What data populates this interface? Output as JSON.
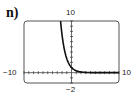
{
  "figure_label": "n)",
  "window": {
    "xmin_label": "−10",
    "xmax_label": "10",
    "ymax_label": "10",
    "ymin_label": "−2"
  },
  "chart_data": {
    "type": "line",
    "title": "n)",
    "xlabel": "",
    "ylabel": "",
    "xlim": [
      -10,
      10
    ],
    "ylim": [
      -2,
      10
    ],
    "x_tick_step": 1,
    "y_tick_step": 1,
    "grid": false,
    "legend": null,
    "series": [
      {
        "name": "curve",
        "description": "exponential decay, approx y = e^(-x)",
        "x": [
          -2.3,
          -2,
          -1.5,
          -1,
          -0.5,
          0,
          0.5,
          1,
          1.5,
          2,
          3,
          4,
          6,
          8,
          10
        ],
        "y": [
          10,
          7.39,
          4.48,
          2.72,
          1.65,
          1,
          0.61,
          0.37,
          0.22,
          0.14,
          0.05,
          0.02,
          0.0,
          0.0,
          0.0
        ]
      }
    ]
  }
}
